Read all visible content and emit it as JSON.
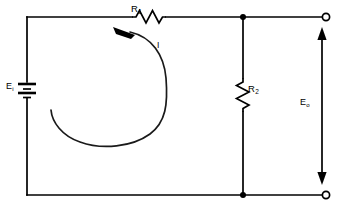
{
  "diagram": {
    "kind": "schematic",
    "background_color": "#ffffff",
    "line_color": "#000000"
  },
  "labels": {
    "r1": {
      "symbol": "R",
      "subscript": "1",
      "text": "R1"
    },
    "r2": {
      "symbol": "R",
      "subscript": "2",
      "text": "R2"
    },
    "ei": {
      "symbol": "E",
      "subscript": "i",
      "text": "Ei"
    },
    "eo": {
      "symbol": "E",
      "subscript": "o",
      "text": "Eo"
    },
    "current": {
      "text": "I"
    }
  },
  "components": [
    {
      "name": "source-battery",
      "type": "battery",
      "label": "Ei",
      "orientation": "vertical",
      "position": "left-branch"
    },
    {
      "name": "series-resistor",
      "type": "resistor",
      "label": "R1",
      "orientation": "horizontal",
      "position": "top-rail"
    },
    {
      "name": "shunt-resistor",
      "type": "resistor",
      "label": "R2",
      "orientation": "vertical",
      "position": "middle-branch"
    }
  ],
  "terminals": [
    {
      "name": "output-terminal-top",
      "style": "open-circle",
      "position": "top-right"
    },
    {
      "name": "output-terminal-bottom",
      "style": "open-circle",
      "position": "bottom-right"
    }
  ],
  "junctions": [
    {
      "name": "node-top",
      "position": "top-rail-middle"
    },
    {
      "name": "node-bottom",
      "position": "bottom-rail-middle"
    }
  ],
  "annotations": [
    {
      "name": "current-loop",
      "label": "I",
      "direction": "counterclockwise",
      "description": "curved arrow indicating loop current"
    },
    {
      "name": "output-voltage-dimension",
      "label": "Eo",
      "style": "double-headed-arrow",
      "description": "vertical arrow spanning the output terminals"
    }
  ]
}
